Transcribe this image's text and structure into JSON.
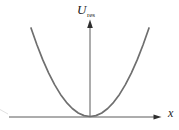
{
  "figure": {
    "y_axis_label": {
      "base": "U",
      "subscript": "res"
    },
    "x_axis_label": "x"
  },
  "colors": {
    "background": "#ffffff",
    "curve": "#6f6f6f",
    "axis": "#5a5a5a",
    "arrow": "#2e2e2e",
    "label": "#1c1c1c",
    "edge_artifact": "#c9c9c9"
  },
  "chart_data": {
    "type": "line",
    "title": "",
    "xlabel": "x",
    "ylabel": "U_res",
    "xlim": [
      -1.37,
      1.2
    ],
    "ylim": [
      0,
      1.1
    ],
    "grid": false,
    "legend_position": null,
    "x_ticks": [],
    "y_ticks": [],
    "series": [
      {
        "name": "U_res(x)",
        "points": [
          [
            -1.0,
            1.0
          ],
          [
            -0.9,
            0.81
          ],
          [
            -0.8,
            0.64
          ],
          [
            -0.7,
            0.49
          ],
          [
            -0.6,
            0.36
          ],
          [
            -0.5,
            0.25
          ],
          [
            -0.4,
            0.16
          ],
          [
            -0.3,
            0.09
          ],
          [
            -0.2,
            0.04
          ],
          [
            -0.1,
            0.01
          ],
          [
            0.0,
            0.0
          ],
          [
            0.1,
            0.01
          ],
          [
            0.2,
            0.04
          ],
          [
            0.3,
            0.09
          ],
          [
            0.4,
            0.16
          ],
          [
            0.5,
            0.25
          ],
          [
            0.6,
            0.36
          ],
          [
            0.7,
            0.49
          ],
          [
            0.8,
            0.64
          ],
          [
            0.9,
            0.81
          ],
          [
            1.0,
            1.0
          ]
        ]
      }
    ]
  }
}
